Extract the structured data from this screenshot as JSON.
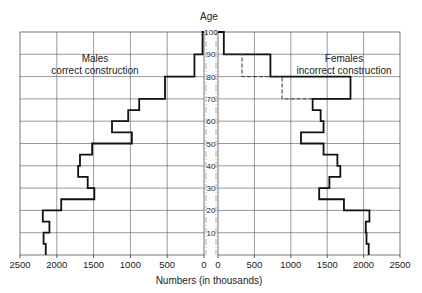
{
  "chart_data": {
    "type": "bar",
    "subtype": "population-pyramid-step",
    "title": "",
    "xlabel": "Numbers (in thousands)",
    "ylabel": "Age",
    "x_ticks_left": [
      "2500",
      "2000",
      "1500",
      "1000",
      "500",
      "0"
    ],
    "x_ticks_right": [
      "0",
      "500",
      "1000",
      "1500",
      "2000",
      "2500"
    ],
    "y_ticks": [
      "100",
      "90",
      "80",
      "70",
      "60",
      "50",
      "40",
      "30",
      "20",
      "10",
      "0"
    ],
    "xlim": [
      0,
      2500
    ],
    "ylim": [
      0,
      100
    ],
    "grid": true,
    "age_bins": [
      [
        0,
        5
      ],
      [
        5,
        10
      ],
      [
        10,
        15
      ],
      [
        15,
        20
      ],
      [
        20,
        25
      ],
      [
        25,
        30
      ],
      [
        30,
        35
      ],
      [
        35,
        40
      ],
      [
        40,
        45
      ],
      [
        45,
        50
      ],
      [
        50,
        55
      ],
      [
        55,
        60
      ],
      [
        60,
        65
      ],
      [
        65,
        70
      ],
      [
        70,
        80
      ],
      [
        80,
        90
      ],
      [
        90,
        100
      ]
    ],
    "series": [
      {
        "name": "Males",
        "annotation": [
          "Males",
          "correct construction"
        ],
        "side": "left",
        "style": "solid",
        "values": [
          2150,
          2180,
          2100,
          2190,
          1940,
          1490,
          1580,
          1710,
          1685,
          1520,
          980,
          1250,
          1030,
          880,
          530,
          130,
          20
        ]
      },
      {
        "name": "Females",
        "annotation": [
          "Females",
          "incorrect construction"
        ],
        "side": "right",
        "style": "solid",
        "values": [
          2070,
          2040,
          2030,
          2080,
          1730,
          1390,
          1530,
          1680,
          1640,
          1450,
          1140,
          1450,
          1410,
          1300,
          1820,
          720,
          80
        ]
      },
      {
        "name": "Females (correct, dashed)",
        "side": "right",
        "style": "dashed",
        "bins": [
          [
            70,
            80
          ],
          [
            80,
            90
          ]
        ],
        "values": [
          880,
          330
        ]
      }
    ]
  },
  "labels": {
    "age_axis": "Age",
    "x_axis": "Numbers (in thousands)",
    "males_line1": "Males",
    "males_line2": "correct construction",
    "females_line1": "Females",
    "females_line2": "incorrect construction"
  }
}
